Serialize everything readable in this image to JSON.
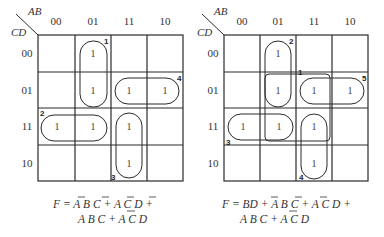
{
  "maps": [
    {
      "axis_row_var": "CD",
      "axis_col_var": "AB",
      "col_labels": [
        "00",
        "01",
        "11",
        "10"
      ],
      "row_labels": [
        "00",
        "01",
        "11",
        "10"
      ],
      "cells": [
        [
          "",
          "1",
          "",
          ""
        ],
        [
          "",
          "1",
          "1",
          "1"
        ],
        [
          "1",
          "1",
          "1",
          ""
        ],
        [
          "",
          "",
          "1",
          ""
        ]
      ],
      "loop_numbers": [
        "1",
        "2",
        "3",
        "4"
      ],
      "equation_line1": "F = A B C + A C D +",
      "equation_line2": "A B C + A C D"
    },
    {
      "axis_row_var": "CD",
      "axis_col_var": "AB",
      "col_labels": [
        "00",
        "01",
        "11",
        "10"
      ],
      "row_labels": [
        "00",
        "01",
        "11",
        "10"
      ],
      "cells": [
        [
          "",
          "1",
          "",
          ""
        ],
        [
          "",
          "1",
          "1",
          "1"
        ],
        [
          "1",
          "1",
          "1",
          ""
        ],
        [
          "",
          "",
          "1",
          ""
        ]
      ],
      "loop_numbers": [
        "1",
        "2",
        "3",
        "4",
        "5"
      ],
      "equation_line1": "F = BD + A B C + A C D +",
      "equation_line2": "A B C + A C D"
    }
  ]
}
